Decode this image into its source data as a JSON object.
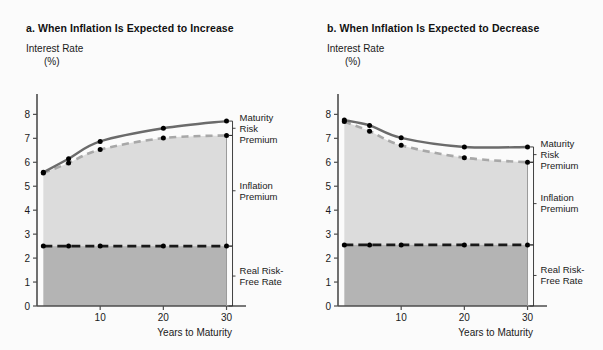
{
  "figure": {
    "background_color": "#fbfbfb",
    "panel_count": 2
  },
  "panels": [
    {
      "id": "a",
      "title": "a.  When Inflation Is Expected to Increase",
      "y_axis_title": "Interest Rate",
      "y_axis_unit": "(%)",
      "x_axis_title": "Years to Maturity",
      "bracket_labels": {
        "maturity_risk_premium": [
          "Maturity",
          "Risk",
          "Premium"
        ],
        "inflation_premium": [
          "Inflation",
          "Premium"
        ],
        "real_risk_free_rate": [
          "Real Risk-",
          "Free Rate"
        ]
      }
    },
    {
      "id": "b",
      "title": "b.  When Inflation Is Expected to Decrease",
      "y_axis_title": "Interest Rate",
      "y_axis_unit": "(%)",
      "x_axis_title": "Years to Maturity",
      "bracket_labels": {
        "maturity_risk_premium": [
          "Maturity",
          "Risk",
          "Premium"
        ],
        "inflation_premium": [
          "Inflation",
          "Premium"
        ],
        "real_risk_free_rate": [
          "Real Risk-",
          "Free Rate"
        ]
      }
    }
  ],
  "chart_data": [
    {
      "type": "line",
      "panel": "a",
      "title": "a.  When Inflation Is Expected to Increase",
      "xlabel": "Years to Maturity",
      "ylabel": "Interest Rate (%)",
      "xlim": [
        0,
        31.5
      ],
      "ylim": [
        0,
        8.6
      ],
      "xticks": [
        10,
        20,
        30
      ],
      "xtick_labels": [
        "10",
        "20",
        "30"
      ],
      "yticks": [
        0,
        1,
        2,
        3,
        4,
        5,
        6,
        7,
        8
      ],
      "ytick_labels": [
        "0",
        "1",
        "2",
        "3",
        "4",
        "5",
        "6",
        "7",
        "8"
      ],
      "grid": false,
      "legend": "none",
      "marker_x": [
        1,
        5,
        10,
        20,
        30
      ],
      "series": [
        {
          "name": "Nominal Interest Rate (with Maturity Risk Premium)",
          "style": "solid",
          "color": "#6b6b6b",
          "x": [
            1,
            5,
            10,
            20,
            30
          ],
          "values": [
            5.58,
            6.15,
            6.87,
            7.42,
            7.72
          ]
        },
        {
          "name": "Real Risk-Free Rate plus Inflation Premium",
          "style": "dashed",
          "color": "#a8a8a8",
          "x": [
            1,
            5,
            10,
            20,
            30
          ],
          "values": [
            5.55,
            5.97,
            6.53,
            7.01,
            7.12
          ]
        },
        {
          "name": "Real Risk-Free Rate",
          "style": "dashed",
          "color": "#1a1a1a",
          "x": [
            1,
            5,
            10,
            20,
            30
          ],
          "values": [
            2.5,
            2.5,
            2.5,
            2.5,
            2.5
          ]
        }
      ],
      "fills": [
        {
          "name": "Inflation Premium",
          "from_series": "Real Risk-Free Rate",
          "to_series": "Real Risk-Free Rate plus Inflation Premium",
          "color": "#dcdcdc"
        },
        {
          "name": "Real Risk-Free Rate",
          "from_value": 0,
          "to_series": "Real Risk-Free Rate",
          "color": "#b4b4b4"
        }
      ]
    },
    {
      "type": "line",
      "panel": "b",
      "title": "b.  When Inflation Is Expected to Decrease",
      "xlabel": "Years to Maturity",
      "ylabel": "Interest Rate (%)",
      "xlim": [
        0,
        31.5
      ],
      "ylim": [
        0,
        8.6
      ],
      "xticks": [
        10,
        20,
        30
      ],
      "xtick_labels": [
        "10",
        "20",
        "30"
      ],
      "yticks": [
        0,
        1,
        2,
        3,
        4,
        5,
        6,
        7,
        8
      ],
      "ytick_labels": [
        "0",
        "1",
        "2",
        "3",
        "4",
        "5",
        "6",
        "7",
        "8"
      ],
      "grid": false,
      "legend": "none",
      "marker_x": [
        1,
        5,
        10,
        20,
        30
      ],
      "series": [
        {
          "name": "Nominal Interest Rate (with Maturity Risk Premium)",
          "style": "solid",
          "color": "#6b6b6b",
          "x": [
            1,
            5,
            10,
            20,
            30
          ],
          "values": [
            7.76,
            7.54,
            7.02,
            6.64,
            6.64
          ]
        },
        {
          "name": "Real Risk-Free Rate plus Inflation Premium",
          "style": "dashed",
          "color": "#a8a8a8",
          "x": [
            1,
            5,
            10,
            20,
            30
          ],
          "values": [
            7.7,
            7.3,
            6.71,
            6.19,
            6.0
          ]
        },
        {
          "name": "Real Risk-Free Rate",
          "style": "dashed",
          "color": "#1a1a1a",
          "x": [
            1,
            5,
            10,
            20,
            30
          ],
          "values": [
            2.55,
            2.55,
            2.55,
            2.55,
            2.55
          ]
        }
      ],
      "fills": [
        {
          "name": "Inflation Premium",
          "from_series": "Real Risk-Free Rate",
          "to_series": "Real Risk-Free Rate plus Inflation Premium",
          "color": "#dcdcdc"
        },
        {
          "name": "Real Risk-Free Rate",
          "from_value": 0,
          "to_series": "Real Risk-Free Rate",
          "color": "#b4b4b4"
        }
      ]
    }
  ],
  "colors": {
    "upper_area": "#dcdcdc",
    "lower_area": "#b4b4b4",
    "solid_line": "#6b6b6b",
    "dashed_line": "#a8a8a8",
    "real_rate_line": "#1a1a1a",
    "marker": "#000000",
    "axis": "#4d4d4d",
    "text": "#1a1a1a"
  }
}
